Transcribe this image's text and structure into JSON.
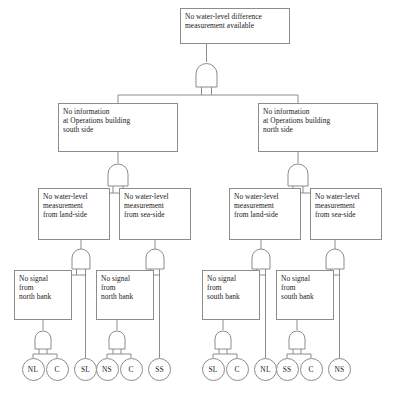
{
  "diagram": {
    "type": "fault-tree",
    "gate_type": "AND",
    "line_color": "#8c8c8c",
    "background": "#ffffff",
    "top_event": {
      "label": "No water-level difference\nmeasurement available"
    },
    "level2": [
      {
        "label": "No information\nat Operations building\nsouth side"
      },
      {
        "label": "No information\nat Operations building\nnorth side"
      }
    ],
    "level3": [
      {
        "label": "No water-level\nmeasurement\nfrom land-side"
      },
      {
        "label": "No water-level\nmeasurement\nfrom sea-side"
      },
      {
        "label": "No water-level\nmeasurement\nfrom land-side"
      },
      {
        "label": "No water-level\nmeasurement\nfrom sea-side"
      }
    ],
    "level4": [
      {
        "label": "No signal\nfrom\nnorth bank"
      },
      {
        "label": "No signal\nfrom\nnorth bank"
      },
      {
        "label": "No signal\nfrom\nsouth bank"
      },
      {
        "label": "No signal\nfrom\nsouth bank"
      }
    ],
    "basic_events": [
      {
        "label": "NL"
      },
      {
        "label": "C"
      },
      {
        "label": "SL"
      },
      {
        "label": "NS"
      },
      {
        "label": "C"
      },
      {
        "label": "SS"
      },
      {
        "label": "SL"
      },
      {
        "label": "C"
      },
      {
        "label": "NL"
      },
      {
        "label": "SS"
      },
      {
        "label": "C"
      },
      {
        "label": "NS"
      }
    ]
  }
}
